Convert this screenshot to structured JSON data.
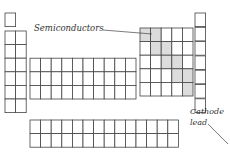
{
  "labels": {
    "semiconductors": "Semiconductors",
    "cathode_line1": "Cathode",
    "cathode_line2": "lead"
  },
  "colors": {
    "cell_stroke": "#444444",
    "shaded_fill": "#dcdcdc",
    "background": "#ffffff"
  },
  "grid": {
    "cell_width": 10.6,
    "cell_height": 13.6
  }
}
